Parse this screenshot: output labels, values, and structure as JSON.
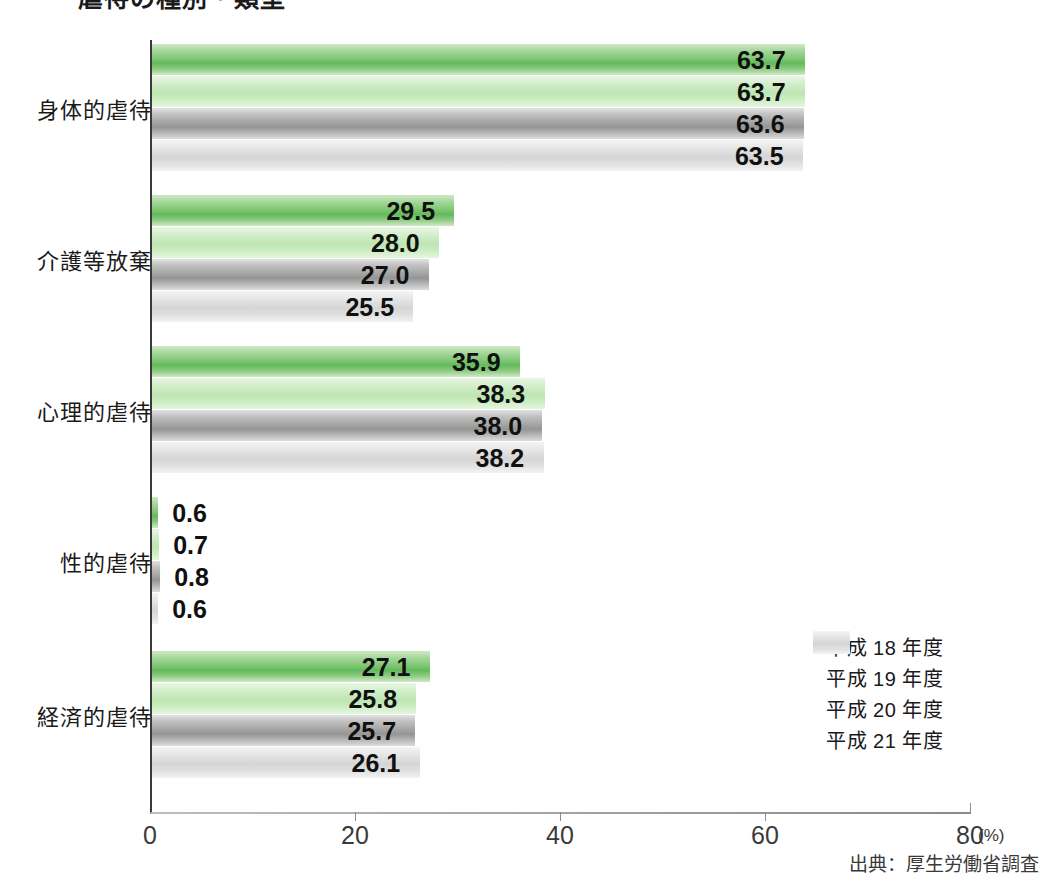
{
  "title": {
    "text": "虐待の種別・類型",
    "bullet_color": "#5cb860"
  },
  "source": {
    "text": "出典：厚生労働省調査"
  },
  "axis": {
    "unit_label": "(%)",
    "tick_labels": [
      "0",
      "20",
      "40",
      "60",
      "80"
    ]
  },
  "legend": {
    "items": [
      {
        "label": "平成 18 年度",
        "color": "#63b95c"
      },
      {
        "label": "平成 19 年度",
        "color": "#bde5b2"
      },
      {
        "label": "平成 20 年度",
        "color": "#a3a3a3"
      },
      {
        "label": "平成 21 年度",
        "color": "#d5d5d5"
      }
    ]
  },
  "chart_data": {
    "type": "bar",
    "orientation": "horizontal",
    "title": "虐待の種別・類型",
    "xlabel": "(%)",
    "ylabel": "",
    "xlim": [
      0,
      80
    ],
    "xticks": [
      0,
      20,
      40,
      60,
      80
    ],
    "grid": false,
    "legend_position": "right-middle",
    "categories": [
      "身体的虐待",
      "介護等放棄",
      "心理的虐待",
      "性的虐待",
      "経済的虐待"
    ],
    "series": [
      {
        "name": "平成 18 年度",
        "color": "#63b95c",
        "values": [
          63.7,
          29.5,
          35.9,
          0.6,
          27.1
        ]
      },
      {
        "name": "平成 19 年度",
        "color": "#bde5b2",
        "values": [
          63.7,
          28.0,
          38.3,
          0.7,
          25.8
        ]
      },
      {
        "name": "平成 20 年度",
        "color": "#a3a3a3",
        "values": [
          63.6,
          27.0,
          38.0,
          0.8,
          25.7
        ]
      },
      {
        "name": "平成 21 年度",
        "color": "#d5d5d5",
        "values": [
          63.5,
          25.5,
          38.2,
          0.6,
          26.1
        ]
      }
    ],
    "value_labels": [
      [
        "63.7",
        "63.7",
        "63.6",
        "63.5"
      ],
      [
        "29.5",
        "28.0",
        "27.0",
        "25.5"
      ],
      [
        "35.9",
        "38.3",
        "38.0",
        "38.2"
      ],
      [
        "0.6",
        "0.7",
        "0.8",
        "0.6"
      ],
      [
        "27.1",
        "25.8",
        "25.7",
        "26.1"
      ]
    ],
    "source": "出典：厚生労働省調査"
  }
}
